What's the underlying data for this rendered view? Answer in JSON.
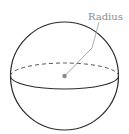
{
  "diagram": {
    "label": "Radius",
    "colors": {
      "outline": "#2a2a2a",
      "label": "#8a8a8a",
      "center_dot": "#8a8a8a",
      "radius_line": "#9a9a9a"
    }
  }
}
